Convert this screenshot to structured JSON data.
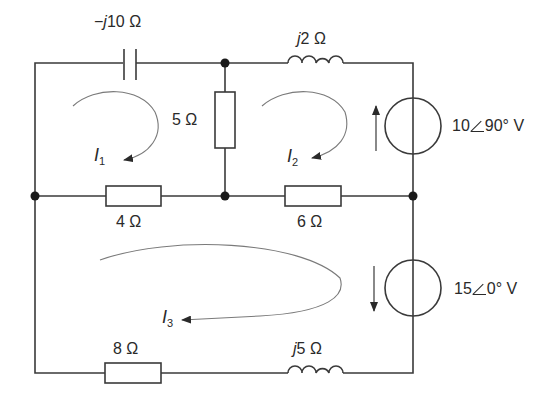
{
  "diagram": {
    "type": "circuit-schematic",
    "colors": {
      "wire": "#3a3a3a",
      "mesh_arrow": "#7a7a7a",
      "text": "#2a2a2a",
      "background": "#ffffff"
    },
    "components": {
      "capacitor": {
        "label_prefix": "−",
        "label_j": "j",
        "label_value": "10 Ω"
      },
      "inductor_top": {
        "label_j": "j",
        "label_value": "2 Ω"
      },
      "resistor_5": {
        "label": "5 Ω"
      },
      "resistor_4": {
        "label": "4 Ω"
      },
      "resistor_6": {
        "label": "6 Ω"
      },
      "resistor_8": {
        "label": "8 Ω"
      },
      "inductor_bottom": {
        "label_j": "j",
        "label_value": "5 Ω"
      },
      "source_top": {
        "magnitude": "10",
        "angle": "90° V",
        "arrow_direction": "up"
      },
      "source_bottom": {
        "magnitude": "15",
        "angle": "0° V",
        "arrow_direction": "down"
      }
    },
    "mesh_currents": [
      {
        "symbol": "I",
        "subscript": "1",
        "direction": "clockwise"
      },
      {
        "symbol": "I",
        "subscript": "2",
        "direction": "clockwise"
      },
      {
        "symbol": "I",
        "subscript": "3",
        "direction": "clockwise"
      }
    ]
  }
}
